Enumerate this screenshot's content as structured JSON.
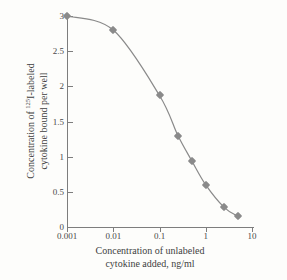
{
  "chart_data": {
    "type": "line",
    "title": "",
    "subtitle": "",
    "xlabel_lines": [
      "Concentration of unlabeled",
      "cytokine added, ng/ml"
    ],
    "ylabel_lines": [
      "Concentration of 125I-labeled",
      "cytokine bound per well"
    ],
    "ylabel_prefix": "Concentration of ",
    "ylabel_superscript": "125",
    "ylabel_suffix": "I-labeled",
    "ylabel_line2": "cytokine bound per well",
    "x_scale": "log",
    "y_scale": "linear",
    "xlim": [
      0.001,
      10
    ],
    "ylim": [
      0,
      3
    ],
    "grid": false,
    "legend": "none",
    "x_tick_labels": [
      "0.001",
      "0.01",
      "0.1",
      "1",
      "10"
    ],
    "x_tick_values": [
      0.001,
      0.01,
      0.1,
      1,
      10
    ],
    "y_tick_labels": [
      "0",
      "0.5",
      "1",
      "1.5",
      "2",
      "2.5",
      "3"
    ],
    "y_tick_values": [
      0,
      0.5,
      1,
      1.5,
      2,
      2.5,
      3
    ],
    "series": [
      {
        "name": "bound labeled cytokine",
        "marker": "diamond",
        "color": "#8a8a8a",
        "line_color": "#8a8a8a",
        "x": [
          0.001,
          0.01,
          0.1,
          0.25,
          0.5,
          1.0,
          2.5,
          5.0
        ],
        "y": [
          3.0,
          2.8,
          1.87,
          1.3,
          0.94,
          0.6,
          0.28,
          0.15
        ]
      }
    ],
    "colors": {
      "curve": "#8a8a8a",
      "marker": "#8a8a8a",
      "axis": "#7d7d7d",
      "text": "#3f3f3f",
      "background": "#fdfdfb"
    }
  }
}
